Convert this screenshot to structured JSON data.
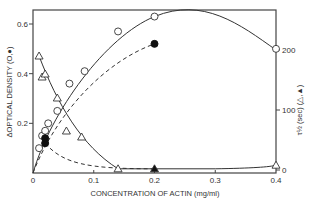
{
  "chart_data": {
    "type": "scatter",
    "title": "",
    "xlabel": "CONCENTRATION OF ACTIN (mg/ml)",
    "ylabel": "ΔOPTICAL DENSITY (O,●)",
    "y2label": "τ½ (sec) (△,▲)",
    "xlim": [
      0,
      0.4
    ],
    "ylim": [
      0,
      0.65
    ],
    "y2lim": [
      0,
      260
    ],
    "x_ticks": [
      "0",
      "0.1",
      "0.2",
      "0.3",
      "0.4"
    ],
    "y_ticks": [
      "0.2",
      "0.4",
      "0.6"
    ],
    "y2_ticks": [
      "0",
      "100",
      "200"
    ],
    "grid": false,
    "series": [
      {
        "name": "ΔOD open circles",
        "marker": "open-circle",
        "axis": "left",
        "line": "solid",
        "x": [
          0.01,
          0.015,
          0.02,
          0.025,
          0.04,
          0.06,
          0.085,
          0.14,
          0.2,
          0.4
        ],
        "y": [
          0.1,
          0.15,
          0.17,
          0.2,
          0.25,
          0.36,
          0.41,
          0.57,
          0.63,
          0.5
        ]
      },
      {
        "name": "ΔOD filled circles",
        "marker": "filled-circle",
        "axis": "left",
        "line": "dashed",
        "x": [
          0.02,
          0.02,
          0.2
        ],
        "y": [
          0.12,
          0.14,
          0.52
        ]
      },
      {
        "name": "τ½ open triangles",
        "marker": "open-triangle",
        "axis": "right",
        "line": "solid",
        "x": [
          0.01,
          0.015,
          0.02,
          0.04,
          0.055,
          0.08,
          0.14,
          0.4
        ],
        "y": [
          190,
          155,
          160,
          120,
          65,
          55,
          2,
          8
        ]
      },
      {
        "name": "τ½ filled triangles",
        "marker": "filled-triangle",
        "axis": "right",
        "line": "dashed",
        "x": [
          0.2
        ],
        "y": [
          2
        ]
      }
    ]
  },
  "labels": {
    "xlabel": "CONCENTRATION OF ACTIN (mg/ml)",
    "ylabel": "ΔOPTICAL DENSITY (O,●)",
    "y2label": "τ½ (sec) (△,▲)",
    "origin": "0"
  }
}
